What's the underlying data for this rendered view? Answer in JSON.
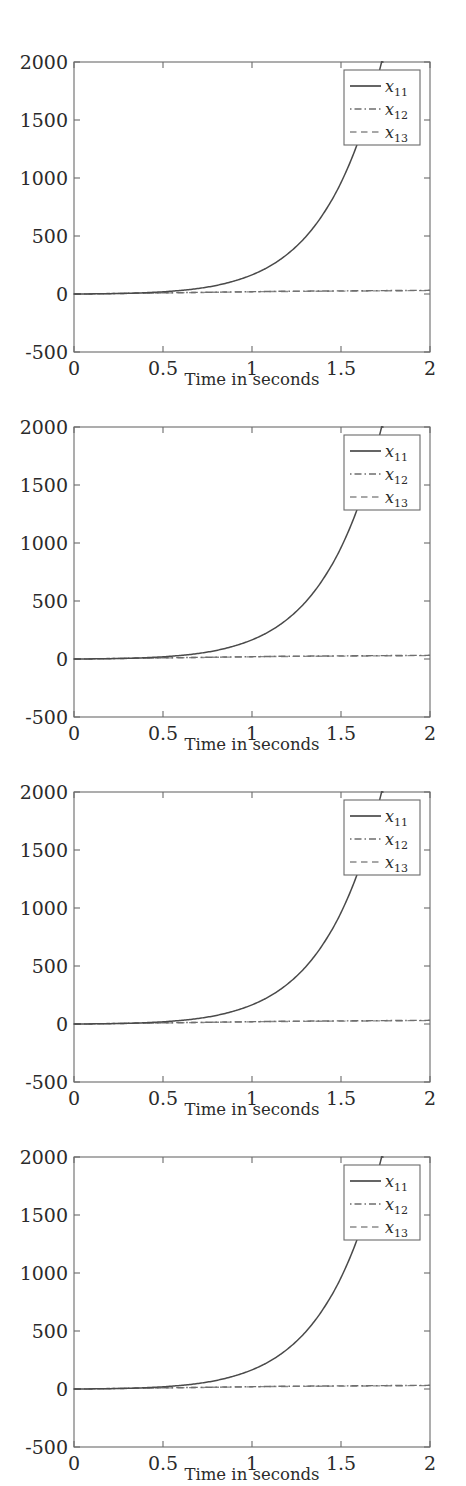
{
  "figure": {
    "panel_count": 4,
    "background_color": "#ffffff"
  },
  "chart_data": {
    "type": "line",
    "title": "",
    "subtitle": "",
    "xlabel": "Time in seconds",
    "ylabel": "",
    "xlim": [
      0,
      2
    ],
    "ylim": [
      -500,
      2000
    ],
    "xticks": [
      0,
      0.5,
      1,
      1.5,
      2
    ],
    "xtick_labels": [
      "0",
      "0.5",
      "1",
      "1.5",
      "2"
    ],
    "yticks": [
      -500,
      0,
      500,
      1000,
      1500,
      2000
    ],
    "ytick_labels": [
      "-500",
      "0",
      "500",
      "1000",
      "1500",
      "2000"
    ],
    "grid": false,
    "legend_position": "upper right",
    "legend_entries": [
      {
        "label": "x11",
        "base": "x",
        "sub": "11",
        "style": "solid",
        "color": "#3f3f3f"
      },
      {
        "label": "x12",
        "base": "x",
        "sub": "12",
        "style": "dashdot",
        "color": "#6e6e6e"
      },
      {
        "label": "x13",
        "base": "x",
        "sub": "13",
        "style": "dashed",
        "color": "#8a8a8a"
      }
    ],
    "x": [
      0,
      0.1,
      0.2,
      0.3,
      0.4,
      0.5,
      0.6,
      0.7,
      0.8,
      0.9,
      1.0,
      1.1,
      1.2,
      1.3,
      1.4,
      1.5,
      1.6,
      1.7,
      1.8,
      1.9,
      1.95,
      2.0
    ],
    "series": [
      {
        "name": "x11",
        "style": "solid",
        "values": [
          0,
          1,
          3,
          6,
          11,
          19,
          31,
          48,
          74,
          112,
          165,
          240,
          345,
          490,
          690,
          960,
          1330,
          1830,
          2500,
          3400,
          4000,
          4600
        ]
      },
      {
        "name": "x12",
        "style": "dashdot",
        "values": [
          0,
          2,
          4,
          6,
          8,
          10,
          12,
          14,
          16,
          18,
          20,
          22,
          24,
          25,
          26,
          27,
          28,
          29,
          30,
          31,
          31,
          32
        ]
      },
      {
        "name": "x13",
        "style": "dashed",
        "values": [
          0,
          1,
          3,
          5,
          7,
          9,
          11,
          13,
          15,
          17,
          19,
          21,
          22,
          23,
          24,
          25,
          26,
          27,
          28,
          29,
          29,
          30
        ]
      }
    ],
    "panels": [
      {
        "index": 1,
        "identical_to_panel": 1
      },
      {
        "index": 2,
        "identical_to_panel": 1
      },
      {
        "index": 3,
        "identical_to_panel": 1
      },
      {
        "index": 4,
        "identical_to_panel": 1
      }
    ]
  }
}
